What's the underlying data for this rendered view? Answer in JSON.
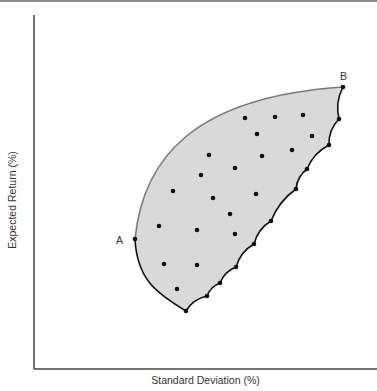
{
  "chart_data": {
    "type": "scatter",
    "title": "",
    "xlabel": "Standard Deviation (%)",
    "ylabel": "Expected Return (%)",
    "grid": false,
    "legend": null,
    "ticks": {
      "x": [],
      "y": []
    },
    "annotations": [
      {
        "label": "A",
        "role": "left-most boundary point (minimum-variance region edge)"
      },
      {
        "label": "B",
        "role": "top-right boundary point (highest return)"
      }
    ],
    "pixel_space": {
      "x_axis_y": 369,
      "y_axis_x": 34,
      "plot_top": 15,
      "plot_right": 377
    },
    "region": {
      "fill": "#d9d9d9",
      "upper_edge_color": "#7a7a7a",
      "lower_edge_color": "#111111",
      "point_A": [
        135,
        239
      ],
      "point_B": [
        343,
        87
      ],
      "bottom_cusp": [
        186,
        311
      ],
      "right_boundary_points": [
        [
          343,
          87
        ],
        [
          339,
          119
        ],
        [
          329,
          145
        ],
        [
          307,
          169
        ],
        [
          296,
          189
        ],
        [
          271,
          221
        ],
        [
          254,
          244
        ],
        [
          236,
          267
        ],
        [
          220,
          283
        ],
        [
          207,
          296
        ],
        [
          186,
          311
        ]
      ]
    },
    "interior_points": [
      [
        245,
        118
      ],
      [
        275,
        117
      ],
      [
        303,
        115
      ],
      [
        257,
        134
      ],
      [
        312,
        136
      ],
      [
        209,
        155
      ],
      [
        262,
        156
      ],
      [
        292,
        150
      ],
      [
        201,
        175
      ],
      [
        235,
        168
      ],
      [
        173,
        191
      ],
      [
        256,
        194
      ],
      [
        213,
        198
      ],
      [
        230,
        214
      ],
      [
        159,
        226
      ],
      [
        197,
        230
      ],
      [
        235,
        234
      ],
      [
        164,
        264
      ],
      [
        197,
        265
      ],
      [
        177,
        289
      ]
    ]
  },
  "labels": {
    "x_axis": "Standard Deviation (%)",
    "y_axis": "Expected Return (%)",
    "point_a": "A",
    "point_b": "B"
  }
}
